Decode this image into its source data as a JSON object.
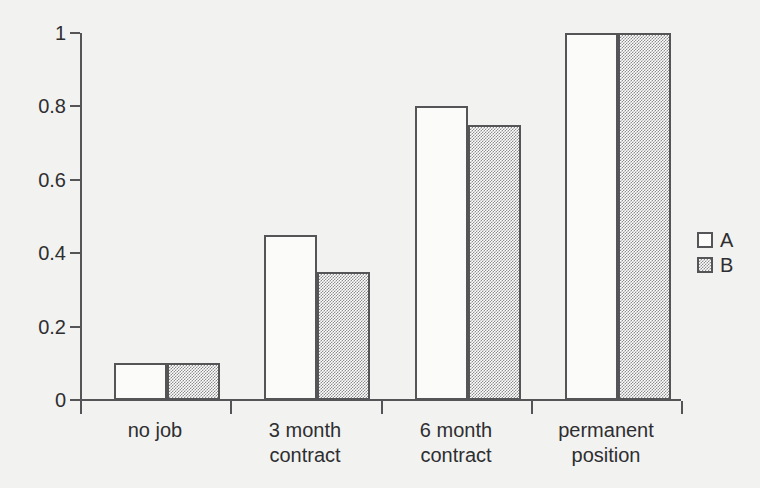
{
  "chart_data": {
    "type": "bar",
    "title": "",
    "xlabel": "",
    "ylabel": "",
    "ylim": [
      0,
      1
    ],
    "yticks": [
      "0",
      "0.2",
      "0.4",
      "0.6",
      "0.8",
      "1"
    ],
    "ytick_values": [
      0,
      0.2,
      0.4,
      0.6,
      0.8,
      1
    ],
    "grid": false,
    "legend_position": "right",
    "categories": [
      "no job",
      "3 month contract",
      "6 month contract",
      "permanent position"
    ],
    "category_lines": [
      [
        "no job"
      ],
      [
        "3 month",
        "contract"
      ],
      [
        "6 month",
        "contract"
      ],
      [
        "permanent",
        "position"
      ]
    ],
    "series": [
      {
        "name": "A",
        "values": [
          0.1,
          0.45,
          0.8,
          1.0
        ],
        "fill": "#fbfbfa",
        "pattern": "solid-white"
      },
      {
        "name": "B",
        "values": [
          0.1,
          0.35,
          0.75,
          1.0
        ],
        "fill": "#a8a8a8",
        "pattern": "checkerboard-gray"
      }
    ]
  },
  "style": {
    "background": "#f2f2f0",
    "line_color": "#555557",
    "text_color": "#2e2e30"
  }
}
